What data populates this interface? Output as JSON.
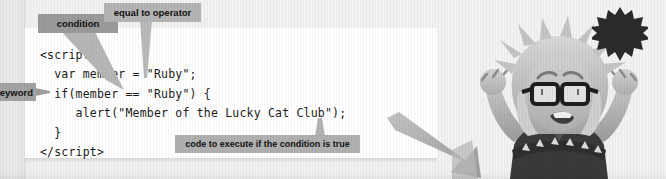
{
  "page": {
    "badge_number": "1",
    "background_color": "#f0f0f0",
    "panel_color": "#ffffff"
  },
  "code_panel": {
    "language": "html-javascript",
    "lines": [
      "<script>",
      "  var member = \"Ruby\";",
      "  if(member == \"Ruby\") {",
      "     alert(\"Member of the Lucky Cat Club\");",
      "  }",
      "</script>"
    ],
    "full_text": "<script>\n  var member = \"Ruby\";\n  if(member == \"Ruby\") {\n     alert(\"Member of the Lucky Cat Club\");\n  }\n</script>"
  },
  "callouts": [
    {
      "id": "condition",
      "label": "condition",
      "color": "#9a9a9a",
      "points_to": "if(member == \"Ruby\")"
    },
    {
      "id": "equal-to-operator",
      "label": "equal to operator",
      "color": "#b4b4b4",
      "points_to": "=="
    },
    {
      "id": "keyword",
      "label": "keyword",
      "color": "#a3a3a3",
      "points_to": "if",
      "clipped_left": true
    },
    {
      "id": "code-to-execute",
      "label": "code to execute if the condition is true",
      "color": "#b0b0b0",
      "points_to": "alert(\"Member of the Lucky Cat Club\");"
    }
  ],
  "illustration": {
    "character_name": "cheering-character",
    "description": "cartoon character with spiky hair and glasses raising both fists",
    "arrow_name": "diagonal-arrow",
    "arrow_color": "#a8a8a8"
  }
}
